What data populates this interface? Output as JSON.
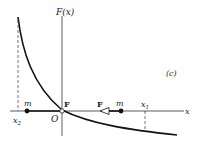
{
  "diagram": {
    "panel_label": "(c)",
    "y_axis_label": "F(x)",
    "x_axis_label": "x",
    "origin_label": "O",
    "points": [
      {
        "label": "x2",
        "main": "x",
        "sub": "2"
      },
      {
        "label": "x1",
        "main": "x",
        "sub": "1"
      }
    ],
    "masses": [
      {
        "label": "m",
        "position": "x2"
      },
      {
        "label": "m",
        "position": "right"
      }
    ],
    "forces": [
      {
        "label": "F",
        "position": "origin"
      },
      {
        "label": "F",
        "position": "arrow",
        "direction": "left"
      }
    ],
    "colors": {
      "ink": "#1a1a1a",
      "background": "#ffffff"
    }
  }
}
